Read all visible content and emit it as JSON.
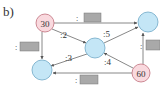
{
  "figure_label": "b)",
  "colors": {
    "source_node_fill": "#f9d9de",
    "source_node_stroke": "#c0707c",
    "plain_node_fill": "#c4e6f6",
    "plain_node_stroke": "#6fa8c6",
    "box_fill": "#a9a9a9",
    "box_stroke": "#777777",
    "edge": "#6a6a6a"
  },
  "nodes": [
    {
      "id": "n30",
      "label": "30",
      "type": "source",
      "cx": 45,
      "cy": 23,
      "r": 9
    },
    {
      "id": "n_top_right",
      "label": "",
      "type": "plain",
      "cx": 148,
      "cy": 22,
      "r": 10
    },
    {
      "id": "n_center",
      "label": "",
      "type": "plain",
      "cx": 95,
      "cy": 48,
      "r": 10
    },
    {
      "id": "n_bottom_left",
      "label": "",
      "type": "plain",
      "cx": 42,
      "cy": 70,
      "r": 10
    },
    {
      "id": "n60",
      "label": "60",
      "type": "source",
      "cx": 141,
      "cy": 73,
      "r": 9
    }
  ],
  "edges": [
    {
      "from": "n30",
      "to": "n_top_right",
      "label": ":",
      "box": true
    },
    {
      "from": "n30",
      "to": "n_bottom_left",
      "label": ":",
      "box": true
    },
    {
      "from": "n30",
      "to": "n_center",
      "label": ":2",
      "box": false
    },
    {
      "from": "n_center",
      "to": "n_top_right",
      "label": ":5",
      "box": false
    },
    {
      "from": "n_center",
      "to": "n_bottom_left",
      "label": ":3",
      "box": false
    },
    {
      "from": "n60",
      "to": "n_center",
      "label": ":4",
      "box": false
    },
    {
      "from": "n60",
      "to": "n_top_right",
      "label": ":",
      "box": true
    },
    {
      "from": "n60",
      "to": "n_bottom_left",
      "label": ":",
      "box": true
    }
  ],
  "edge_labels": {
    "e2": ":2",
    "e5": ":5",
    "e3": ":3",
    "e4": ":4",
    "colon": ":"
  }
}
